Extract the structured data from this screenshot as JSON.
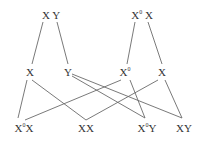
{
  "diagram": {
    "type": "genetic-cross",
    "parents": [
      {
        "id": "p1",
        "label": "X Y",
        "x": 51,
        "y": 10
      },
      {
        "id": "p2",
        "label_base": "X",
        "label_sup": "0",
        "label_tail": " X",
        "x": 142,
        "y": 10
      }
    ],
    "gametes": [
      {
        "id": "g1",
        "label": "X",
        "x": 30,
        "y": 67
      },
      {
        "id": "g2",
        "label": "Y",
        "x": 68,
        "y": 67
      },
      {
        "id": "g3",
        "label_base": "X",
        "label_sup": "0",
        "x": 125,
        "y": 67
      },
      {
        "id": "g4",
        "label": "X",
        "x": 162,
        "y": 67
      }
    ],
    "offspring": [
      {
        "id": "o1",
        "label_base": "X",
        "label_sup": "0",
        "label_tail": "X",
        "x": 24,
        "y": 123
      },
      {
        "id": "o2",
        "label": "XX",
        "x": 86,
        "y": 123
      },
      {
        "id": "o3",
        "label_base": "X",
        "label_sup": "0",
        "label_tail": "Y",
        "x": 147,
        "y": 123
      },
      {
        "id": "o4",
        "label": "XY",
        "x": 184,
        "y": 123
      }
    ],
    "edges": [
      {
        "from": "p1",
        "to": "g1",
        "x1": 43,
        "y1": 22,
        "x2": 32,
        "y2": 64
      },
      {
        "from": "p1",
        "to": "g2",
        "x1": 57,
        "y1": 22,
        "x2": 68,
        "y2": 64
      },
      {
        "from": "p2",
        "to": "g3",
        "x1": 135,
        "y1": 22,
        "x2": 127,
        "y2": 64
      },
      {
        "from": "p2",
        "to": "g4",
        "x1": 148,
        "y1": 22,
        "x2": 162,
        "y2": 64
      },
      {
        "from": "g1",
        "to": "o1",
        "x1": 27,
        "y1": 80,
        "x2": 18,
        "y2": 118
      },
      {
        "from": "g1",
        "to": "o2",
        "x1": 32,
        "y1": 80,
        "x2": 86,
        "y2": 120
      },
      {
        "from": "g2",
        "to": "o3",
        "x1": 72,
        "y1": 76,
        "x2": 145,
        "y2": 118
      },
      {
        "from": "g2",
        "to": "o4",
        "x1": 72,
        "y1": 74,
        "x2": 182,
        "y2": 118
      },
      {
        "from": "g3",
        "to": "o1",
        "x1": 121,
        "y1": 80,
        "x2": 25,
        "y2": 120
      },
      {
        "from": "g3",
        "to": "o3",
        "x1": 130,
        "y1": 80,
        "x2": 145,
        "y2": 118
      },
      {
        "from": "g4",
        "to": "o2",
        "x1": 158,
        "y1": 80,
        "x2": 86,
        "y2": 120
      },
      {
        "from": "g4",
        "to": "o4",
        "x1": 165,
        "y1": 80,
        "x2": 182,
        "y2": 118
      }
    ]
  }
}
